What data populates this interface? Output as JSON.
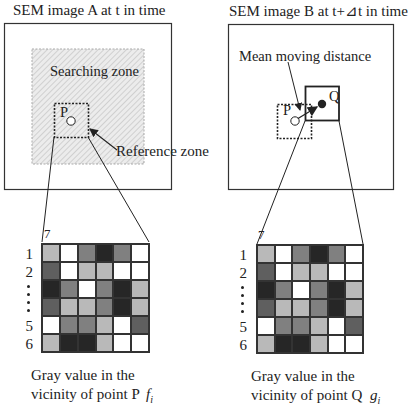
{
  "panel_a": {
    "title": "SEM image A at t in time",
    "searching_zone_label": "Searching zone",
    "reference_zone_label": "Reference zone",
    "point_label": "P",
    "grid_corner_label": "7",
    "row_labels": [
      "1",
      "2",
      "⋮",
      "5",
      "6"
    ],
    "caption_line1": "Gray value in the",
    "caption_line2": "vicinity of point P",
    "symbol_base": "f",
    "symbol_sub": "i"
  },
  "panel_b": {
    "title": "SEM image B at t+⊿t in time",
    "mean_label": "Mean moving distance",
    "point_p_label": "P",
    "point_q_label": "Q",
    "grid_corner_label": "7",
    "row_labels": [
      "1",
      "2",
      "⋮",
      "5",
      "6"
    ],
    "caption_line1": "Gray value in the",
    "caption_line2": "vicinity of point Q",
    "symbol_base": "g",
    "symbol_sub": "i"
  },
  "gray_levels": {
    "W": "#ffffff",
    "L": "#b9b9b9",
    "M": "#808080",
    "D": "#5f5f5f",
    "K": "#262626"
  },
  "grid_cells": [
    [
      "L",
      "W",
      "M",
      "K",
      "M",
      "W"
    ],
    [
      "D",
      "W",
      "L",
      "L",
      "W",
      "W"
    ],
    [
      "K",
      "M",
      "W",
      "M",
      "K",
      "L"
    ],
    [
      "D",
      "L",
      "L",
      "M",
      "K",
      "L"
    ],
    [
      "W",
      "M",
      "M",
      "L",
      "W",
      "D"
    ],
    [
      "L",
      "K",
      "K",
      "L",
      "W",
      "W"
    ]
  ]
}
